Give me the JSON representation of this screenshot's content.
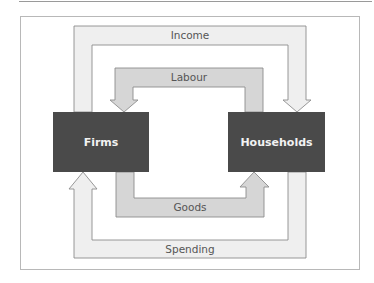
{
  "diagram": {
    "nodes": [
      {
        "id": "firms",
        "label": "Firms"
      },
      {
        "id": "households",
        "label": "Households"
      }
    ],
    "flows": [
      {
        "id": "income",
        "label": "Income",
        "from": "firms",
        "to": "households"
      },
      {
        "id": "labour",
        "label": "Labour",
        "from": "households",
        "to": "firms"
      },
      {
        "id": "goods",
        "label": "Goods",
        "from": "firms",
        "to": "households"
      },
      {
        "id": "spending",
        "label": "Spending",
        "from": "households",
        "to": "firms"
      }
    ],
    "colors": {
      "box": "#4a4a4a",
      "outer_band": "#efefef",
      "inner_band": "#d6d6d6",
      "stroke": "#8c8c8c",
      "frame": "#b8b8b8",
      "text": "#555555"
    }
  }
}
